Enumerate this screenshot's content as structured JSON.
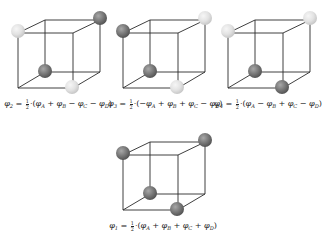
{
  "colors": {
    "edge": "#2a2a2a",
    "sphere_dark": "#7a7a7a",
    "sphere_dark_highlight": "#a8a8a8",
    "sphere_dark_shadow": "#555555",
    "sphere_light": "#e2e2e2",
    "sphere_light_highlight": "#f4f4f4",
    "sphere_light_shadow": "#c8c8c8"
  },
  "cube_geometry": {
    "front": {
      "x0": 18,
      "x1": 73,
      "y0": 33,
      "y1": 88
    },
    "back": {
      "x0": 45,
      "x1": 100,
      "y0": 20,
      "y1": 72
    },
    "sphere_radius": 7
  },
  "panels": [
    {
      "id": "phi2",
      "origin": [
        0,
        0
      ],
      "corners": {
        "front_top_left": "light",
        "back_top_right": "dark",
        "back_bottom_left": "dark",
        "front_bottom_right": "light"
      },
      "formula": {
        "lhs_symbol": "φ",
        "lhs_sub": "2",
        "frac_num": "1",
        "frac_den": "2",
        "terms": [
          {
            "sign": "",
            "symbol": "φ",
            "sub": "A"
          },
          {
            "sign": "+",
            "symbol": "φ",
            "sub": "B"
          },
          {
            "sign": "−",
            "symbol": "φ",
            "sub": "C"
          },
          {
            "sign": "−",
            "symbol": "φ",
            "sub": "D"
          }
        ]
      }
    },
    {
      "id": "phi3",
      "origin": [
        105,
        0
      ],
      "corners": {
        "front_top_left": "dark",
        "back_top_right": "light",
        "back_bottom_left": "dark",
        "front_bottom_right": "light"
      },
      "formula": {
        "lhs_symbol": "φ",
        "lhs_sub": "3",
        "frac_num": "1",
        "frac_den": "2",
        "terms": [
          {
            "sign": "−",
            "symbol": "φ",
            "sub": "A"
          },
          {
            "sign": "+",
            "symbol": "φ",
            "sub": "B"
          },
          {
            "sign": "+",
            "symbol": "φ",
            "sub": "C"
          },
          {
            "sign": "−",
            "symbol": "φ",
            "sub": "D"
          }
        ]
      }
    },
    {
      "id": "phi4",
      "origin": [
        210,
        0
      ],
      "corners": {
        "front_top_left": "light",
        "back_top_right": "light",
        "back_bottom_left": "dark",
        "front_bottom_right": "dark"
      },
      "formula": {
        "lhs_symbol": "φ",
        "lhs_sub": "4",
        "frac_num": "1",
        "frac_den": "2",
        "terms": [
          {
            "sign": "",
            "symbol": "φ",
            "sub": "A"
          },
          {
            "sign": "−",
            "symbol": "φ",
            "sub": "B"
          },
          {
            "sign": "+",
            "symbol": "φ",
            "sub": "C"
          },
          {
            "sign": "−",
            "symbol": "φ",
            "sub": "D"
          }
        ]
      }
    },
    {
      "id": "phi1",
      "origin": [
        105,
        122
      ],
      "corners": {
        "front_top_left": "dark",
        "back_top_right": "dark",
        "back_bottom_left": "dark",
        "front_bottom_right": "dark"
      },
      "formula": {
        "lhs_symbol": "φ",
        "lhs_sub": "1",
        "frac_num": "1",
        "frac_den": "2",
        "terms": [
          {
            "sign": "",
            "symbol": "φ",
            "sub": "A"
          },
          {
            "sign": "+",
            "symbol": "φ",
            "sub": "B"
          },
          {
            "sign": "+",
            "symbol": "φ",
            "sub": "C"
          },
          {
            "sign": "+",
            "symbol": "φ",
            "sub": "D"
          }
        ]
      }
    }
  ]
}
